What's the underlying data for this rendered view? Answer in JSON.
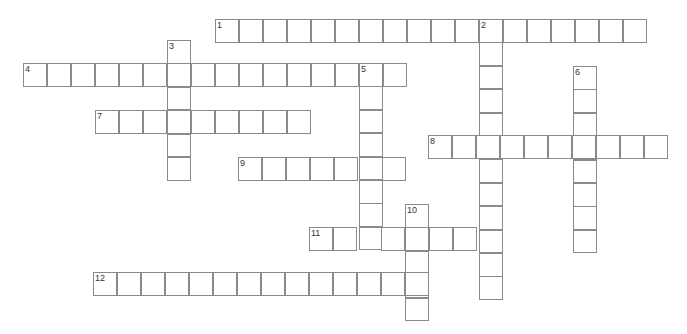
{
  "puzzle": {
    "cell_width": 24,
    "cell_height": 23.4,
    "line_color": "#8a8a8a",
    "background": "#ffffff",
    "clues": [
      {
        "number": "1",
        "direction": "across",
        "x": 215,
        "y": 19,
        "length": 18
      },
      {
        "number": "2",
        "direction": "down",
        "x": 479,
        "y": 19,
        "length": 12
      },
      {
        "number": "3",
        "direction": "down",
        "x": 167,
        "y": 40,
        "length": 6
      },
      {
        "number": "4",
        "direction": "across",
        "x": 23,
        "y": 63,
        "length": 16
      },
      {
        "number": "5",
        "direction": "down",
        "x": 359,
        "y": 63,
        "length": 8
      },
      {
        "number": "6",
        "direction": "down",
        "x": 573,
        "y": 66,
        "length": 8
      },
      {
        "number": "7",
        "direction": "across",
        "x": 95,
        "y": 110,
        "length": 9
      },
      {
        "number": "8",
        "direction": "across",
        "x": 428,
        "y": 135,
        "length": 10
      },
      {
        "number": "9",
        "direction": "across",
        "x": 238,
        "y": 157,
        "length": 7
      },
      {
        "number": "10",
        "direction": "down",
        "x": 405,
        "y": 204,
        "length": 5
      },
      {
        "number": "11",
        "direction": "across",
        "x": 309,
        "y": 227,
        "length": 8
      },
      {
        "number": "12",
        "direction": "across",
        "x": 93,
        "y": 272,
        "length": 14
      }
    ]
  }
}
